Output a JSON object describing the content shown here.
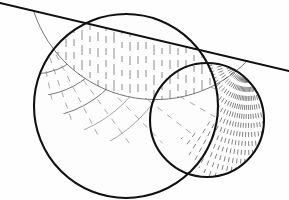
{
  "figure": {
    "background_color": "#fefefe",
    "ink_color": "#111111",
    "hatch_color": "#7a7a7a",
    "thin_line_color": "#4a4a4a",
    "canvas": {
      "width": 289,
      "height": 200
    }
  },
  "geometry": {
    "secant_line": {
      "name": "straight-line",
      "x1": 0,
      "y1": 3,
      "x2": 289,
      "y2": 71,
      "stroke_width": 2.1
    },
    "left_cusp": {
      "name": "left-intersection-point",
      "x": 34,
      "y": 12
    },
    "right_cusp": {
      "name": "right-intersection-point",
      "x": 248,
      "y": 60
    },
    "outer_circle_left": {
      "name": "large-left-circle",
      "cx": 126,
      "cy": 106,
      "r": 92,
      "leftmost_x": 18,
      "bottom_y": 194
    },
    "outer_circle_right": {
      "name": "right-circle",
      "cx": 207,
      "cy": 120,
      "r": 57,
      "rightmost_x": 263,
      "bottom_y": 176
    },
    "inner_arc": {
      "name": "inner-boundary-arc",
      "from_x": 34,
      "from_y": 12,
      "to_x": 248,
      "to_y": 60,
      "lowest_x": 150,
      "lowest_y": 107,
      "radius": 128
    }
  },
  "hatching": {
    "upper_region": {
      "name": "vertical-dash-hatching",
      "direction": "vertical",
      "line_count": 26,
      "spacing_px": 8,
      "dash_pattern": "7 5"
    },
    "left_fan_region": {
      "name": "radial-dash-hatching-left",
      "origin_x": 34,
      "origin_y": 12,
      "ray_count": 13,
      "dash_pattern": "6 6"
    },
    "concentric_arcs": {
      "name": "concentric-arc-family",
      "center_x": 34,
      "center_y": 12,
      "radii": [
        42,
        62,
        84,
        106,
        128
      ],
      "arc_count": 5
    },
    "right_lune_region": {
      "name": "radial-dash-hatching-right",
      "origin_x": 248,
      "origin_y": 60,
      "ray_count": 30,
      "dash_pattern": "5 4"
    }
  }
}
